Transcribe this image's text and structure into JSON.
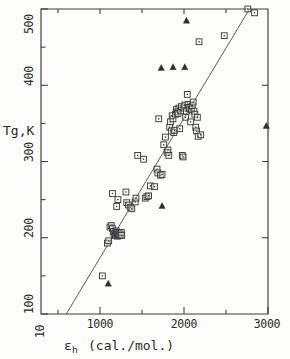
{
  "figure": {
    "caption_present": false,
    "background_color": "#fdfdfb",
    "ink_color": "#2b2b2b"
  },
  "chart_data": {
    "type": "scatter",
    "title": "",
    "xlabel": "εh  (cal./mol.)",
    "xlabel_base": "ε",
    "xlabel_subscript": "h",
    "xlabel_units": "(cal./mol.)",
    "ylabel": "Tg,K",
    "xlim": [
      300,
      3000
    ],
    "ylim": [
      100,
      500
    ],
    "xscale": "linear",
    "yscale": "linear",
    "grid": false,
    "legend": "none",
    "x_major_ticks": [
      1000,
      2000,
      3000
    ],
    "x_major_tick_labels": [
      "1000",
      "2000",
      "3000"
    ],
    "x_minor_ticks": [
      500,
      1500,
      2500
    ],
    "x_origin_labels": [
      "10",
      "100"
    ],
    "y_major_ticks": [
      100,
      200,
      300,
      400,
      500
    ],
    "y_major_tick_labels": [
      "100",
      "200",
      "300",
      "400",
      "500"
    ],
    "y_minor_ticks": [
      150,
      250,
      350,
      450
    ],
    "tick_label_rotation_deg": -90,
    "fit_line": {
      "name": "linear fit",
      "x_start": 600,
      "y_start": 100,
      "x_end": 2780,
      "y_end": 500
    },
    "series": [
      {
        "name": "open squares",
        "marker": "open-square",
        "points": [
          [
            1030,
            150
          ],
          [
            1090,
            193
          ],
          [
            1105,
            196
          ],
          [
            1120,
            214
          ],
          [
            1135,
            216
          ],
          [
            1150,
            212
          ],
          [
            1160,
            208
          ],
          [
            1170,
            205
          ],
          [
            1180,
            206
          ],
          [
            1185,
            203
          ],
          [
            1195,
            209
          ],
          [
            1200,
            204
          ],
          [
            1205,
            207
          ],
          [
            1210,
            202
          ],
          [
            1215,
            205
          ],
          [
            1220,
            204
          ],
          [
            1225,
            206
          ],
          [
            1230,
            203
          ],
          [
            1240,
            205
          ],
          [
            1250,
            204
          ],
          [
            1255,
            207
          ],
          [
            1260,
            203
          ],
          [
            1150,
            258
          ],
          [
            1215,
            250
          ],
          [
            1200,
            241
          ],
          [
            1310,
            260
          ],
          [
            1320,
            246
          ],
          [
            1340,
            243
          ],
          [
            1360,
            240
          ],
          [
            1380,
            238
          ],
          [
            1420,
            247
          ],
          [
            1430,
            252
          ],
          [
            1450,
            308
          ],
          [
            1520,
            303
          ],
          [
            1540,
            252
          ],
          [
            1560,
            254
          ],
          [
            1580,
            255
          ],
          [
            1600,
            268
          ],
          [
            1650,
            267
          ],
          [
            1680,
            290
          ],
          [
            1690,
            285
          ],
          [
            1700,
            356
          ],
          [
            1720,
            282
          ],
          [
            1740,
            283
          ],
          [
            1760,
            322
          ],
          [
            1780,
            332
          ],
          [
            1800,
            312
          ],
          [
            1810,
            315
          ],
          [
            1820,
            308
          ],
          [
            1830,
            345
          ],
          [
            1840,
            352
          ],
          [
            1850,
            340
          ],
          [
            1860,
            360
          ],
          [
            1870,
            356
          ],
          [
            1880,
            338
          ],
          [
            1890,
            341
          ],
          [
            1900,
            362
          ],
          [
            1910,
            368
          ],
          [
            1920,
            365
          ],
          [
            1930,
            363
          ],
          [
            1940,
            370
          ],
          [
            1950,
            343
          ],
          [
            1960,
            367
          ],
          [
            1970,
            372
          ],
          [
            1980,
            308
          ],
          [
            1990,
            306
          ],
          [
            2000,
            370
          ],
          [
            2010,
            374
          ],
          [
            2020,
            358
          ],
          [
            2030,
            366
          ],
          [
            2040,
            388
          ],
          [
            2050,
            375
          ],
          [
            2060,
            371
          ],
          [
            2070,
            369
          ],
          [
            2080,
            352
          ],
          [
            2090,
            368
          ],
          [
            2100,
            373
          ],
          [
            2110,
            378
          ],
          [
            2120,
            366
          ],
          [
            2130,
            362
          ],
          [
            2140,
            345
          ],
          [
            2150,
            340
          ],
          [
            2160,
            358
          ],
          [
            2170,
            333
          ],
          [
            2180,
            457
          ],
          [
            2200,
            335
          ],
          [
            2480,
            465
          ],
          [
            2760,
            500
          ],
          [
            2840,
            495
          ]
        ]
      },
      {
        "name": "filled triangles",
        "marker": "filled-triangle",
        "points": [
          [
            1100,
            140
          ],
          [
            1740,
            242
          ],
          [
            1730,
            423
          ],
          [
            1870,
            424
          ],
          [
            2010,
            424
          ],
          [
            2030,
            485
          ],
          [
            2980,
            347
          ]
        ]
      }
    ]
  }
}
